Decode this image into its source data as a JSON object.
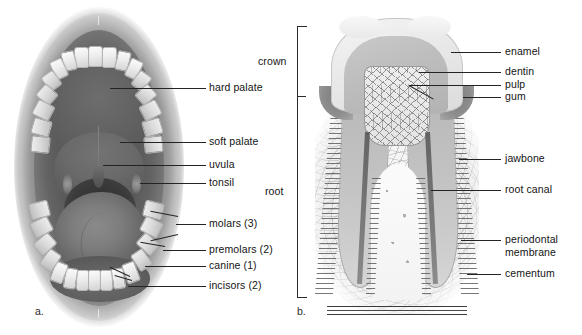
{
  "figure": {
    "type": "anatomical-diagram",
    "background_color": "#ffffff",
    "label_color": "#141414",
    "leader_line_color": "#232323"
  },
  "panel_a": {
    "id": "a.",
    "title": "Open mouth (oral cavity)",
    "labels": [
      {
        "key": "hard_palate",
        "text": "hard palate"
      },
      {
        "key": "soft_palate",
        "text": "soft palate"
      },
      {
        "key": "uvula",
        "text": "uvula"
      },
      {
        "key": "tonsil",
        "text": "tonsil"
      },
      {
        "key": "molars",
        "text": "molars (3)"
      },
      {
        "key": "premolars",
        "text": "premolars (2)"
      },
      {
        "key": "canine",
        "text": "canine (1)"
      },
      {
        "key": "incisors",
        "text": "incisors (2)"
      }
    ]
  },
  "panel_b": {
    "id": "b.",
    "title": "Tooth cross-section",
    "region_brackets": [
      {
        "key": "crown",
        "text": "crown"
      },
      {
        "key": "root",
        "text": "root"
      }
    ],
    "labels": [
      {
        "key": "enamel",
        "text": "enamel"
      },
      {
        "key": "dentin",
        "text": "dentin"
      },
      {
        "key": "pulp",
        "text": "pulp"
      },
      {
        "key": "gum",
        "text": "gum"
      },
      {
        "key": "jawbone",
        "text": "jawbone"
      },
      {
        "key": "root_canal",
        "text": "root canal"
      },
      {
        "key": "periodontal_membrane_line1",
        "text": "periodontal"
      },
      {
        "key": "periodontal_membrane_line2",
        "text": "membrane"
      },
      {
        "key": "cementum",
        "text": "cementum"
      }
    ]
  }
}
